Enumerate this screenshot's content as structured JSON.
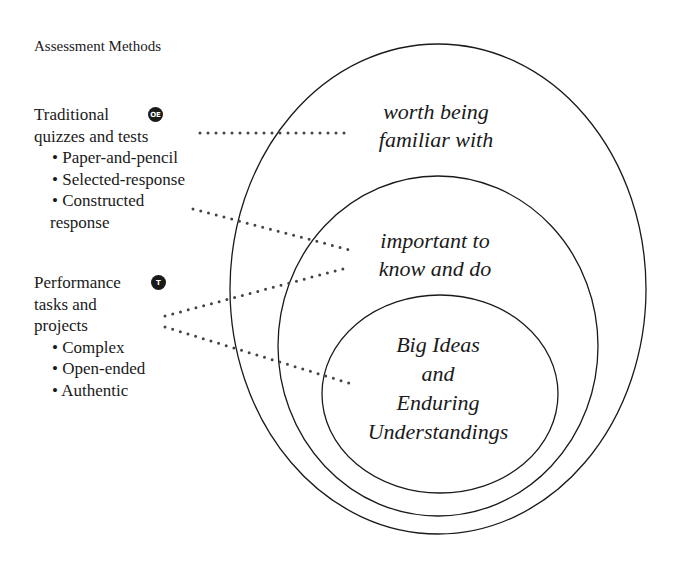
{
  "title": "Assessment Methods",
  "methods": [
    {
      "name_lines": [
        "Traditional",
        "quizzes and tests"
      ],
      "badge": "OE",
      "bullets": [
        "Paper-and-pencil",
        "Selected-response",
        "Constructed"
      ],
      "bullet_continuation": "response"
    },
    {
      "name_lines": [
        "Performance",
        "tasks and",
        "projects"
      ],
      "badge": "T",
      "bullets": [
        "Complex",
        "Open-ended",
        "Authentic"
      ]
    }
  ],
  "bullet_glyph": "•",
  "zones": {
    "outer": [
      "worth being",
      "familiar with"
    ],
    "middle": [
      "important to",
      "know and do"
    ],
    "inner": [
      "Big Ideas",
      "and",
      "Enduring",
      "Understandings"
    ]
  },
  "colors": {
    "ink": "#1a1a1a",
    "dots": "#444444",
    "background": "#ffffff"
  }
}
